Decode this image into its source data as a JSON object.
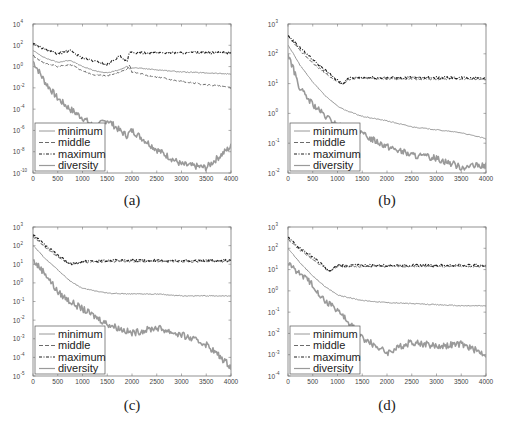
{
  "figure": {
    "panel_labels": [
      "(a)",
      "(b)",
      "(c)",
      "(d)"
    ],
    "legend": [
      "minimum",
      "middle",
      "maximum",
      "diversity"
    ],
    "line_colors": {
      "minimum": "#8c8c8c",
      "middle": "#5a5a5a",
      "maximum": "#1e1e1e",
      "diversity": "#9a9a9a"
    },
    "frame_color": "#777777"
  },
  "chart_data": [
    {
      "type": "line",
      "panel": "(a)",
      "title": "",
      "xlabel": "",
      "ylabel": "",
      "xlim": [
        0,
        4000
      ],
      "x_ticks": [
        0,
        500,
        1000,
        1500,
        2000,
        2500,
        3000,
        3500,
        4000
      ],
      "y_scale": "log",
      "y_ticks_exp": [
        4,
        2,
        0,
        -2,
        -4,
        -6,
        -8,
        -10
      ],
      "ylim_exp": [
        -10,
        4
      ],
      "legend_position": "lower left",
      "x": [
        0,
        250,
        500,
        750,
        1000,
        1250,
        1500,
        1750,
        1900,
        1950,
        2000,
        2500,
        3000,
        3500,
        4000
      ],
      "series": [
        {
          "name": "maximum",
          "log10_values": [
            2.2,
            1.6,
            1.2,
            1.5,
            0.8,
            0.5,
            0.2,
            1.0,
            0.4,
            1.3,
            1.3,
            1.3,
            1.3,
            1.3,
            1.3
          ]
        },
        {
          "name": "middle",
          "log10_values": [
            1.0,
            0.3,
            0.0,
            0.2,
            -0.4,
            -0.8,
            -0.9,
            -0.5,
            -0.3,
            0.2,
            -0.5,
            -1.0,
            -1.4,
            -1.7,
            -2.0
          ]
        },
        {
          "name": "minimum",
          "log10_values": [
            1.5,
            0.8,
            0.4,
            0.6,
            0.0,
            -0.4,
            -0.6,
            -0.3,
            0.0,
            -0.2,
            -0.1,
            -0.3,
            -0.5,
            -0.6,
            -0.7
          ]
        },
        {
          "name": "diversity",
          "log10_values": [
            0.5,
            -1.5,
            -3.0,
            -4.0,
            -4.8,
            -5.7,
            -5.0,
            -6.0,
            -6.5,
            -6.2,
            -6.0,
            -7.8,
            -9.2,
            -9.5,
            -7.5
          ]
        }
      ]
    },
    {
      "type": "line",
      "panel": "(b)",
      "xlim": [
        0,
        4000
      ],
      "x_ticks": [
        0,
        500,
        1000,
        1500,
        2000,
        2500,
        3000,
        3500,
        4000
      ],
      "y_scale": "log",
      "y_ticks_exp": [
        3,
        2,
        1,
        0,
        -1,
        -2
      ],
      "ylim_exp": [
        -2,
        3
      ],
      "legend_position": "lower left",
      "x": [
        0,
        250,
        500,
        750,
        1000,
        1100,
        1250,
        1500,
        2000,
        2500,
        3000,
        3500,
        4000
      ],
      "series": [
        {
          "name": "maximum",
          "log10_values": [
            2.6,
            2.2,
            1.8,
            1.45,
            1.1,
            1.0,
            1.2,
            1.2,
            1.2,
            1.2,
            1.2,
            1.2,
            1.2
          ]
        },
        {
          "name": "middle",
          "log10_values": [
            2.6,
            2.1,
            1.7,
            1.35,
            1.05,
            1.0,
            1.15,
            1.2,
            1.15,
            1.15,
            1.15,
            1.15,
            1.15
          ]
        },
        {
          "name": "minimum",
          "log10_values": [
            2.3,
            1.6,
            1.05,
            0.6,
            0.25,
            0.15,
            0.05,
            -0.1,
            -0.25,
            -0.45,
            -0.55,
            -0.65,
            -0.85
          ]
        },
        {
          "name": "diversity",
          "log10_values": [
            2.0,
            0.8,
            0.3,
            -0.1,
            -0.4,
            -0.45,
            -0.5,
            -0.7,
            -1.1,
            -1.4,
            -1.5,
            -1.8,
            -1.75
          ]
        }
      ]
    },
    {
      "type": "line",
      "panel": "(c)",
      "xlim": [
        0,
        4000
      ],
      "x_ticks": [
        0,
        500,
        1000,
        1500,
        2000,
        2500,
        3000,
        3500,
        4000
      ],
      "y_scale": "log",
      "y_ticks_exp": [
        3,
        2,
        1,
        0,
        -1,
        -2,
        -3,
        -4,
        -5
      ],
      "ylim_exp": [
        -5,
        3
      ],
      "legend_position": "lower left",
      "x": [
        0,
        250,
        500,
        750,
        1000,
        1500,
        2000,
        2500,
        3000,
        3500,
        4000
      ],
      "series": [
        {
          "name": "maximum",
          "log10_values": [
            2.6,
            2.0,
            1.5,
            1.0,
            1.15,
            1.2,
            1.2,
            1.2,
            1.2,
            1.2,
            1.2
          ]
        },
        {
          "name": "middle",
          "log10_values": [
            2.5,
            1.9,
            1.4,
            1.0,
            1.1,
            1.15,
            1.15,
            1.15,
            1.15,
            1.15,
            1.15
          ]
        },
        {
          "name": "minimum",
          "log10_values": [
            2.0,
            1.3,
            0.7,
            0.1,
            -0.3,
            -0.55,
            -0.6,
            -0.6,
            -0.7,
            -0.7,
            -0.7
          ]
        },
        {
          "name": "diversity",
          "log10_values": [
            1.2,
            0.5,
            -0.5,
            -1.0,
            -1.4,
            -2.2,
            -2.7,
            -2.4,
            -2.8,
            -3.3,
            -4.5
          ]
        }
      ]
    },
    {
      "type": "line",
      "panel": "(d)",
      "xlim": [
        0,
        4000
      ],
      "x_ticks": [
        0,
        500,
        1000,
        1500,
        2000,
        2500,
        3000,
        3500,
        4000
      ],
      "y_scale": "log",
      "y_ticks_exp": [
        3,
        2,
        1,
        0,
        -1,
        -2,
        -3,
        -4
      ],
      "ylim_exp": [
        -4,
        3
      ],
      "legend_position": "lower left",
      "x": [
        0,
        250,
        500,
        750,
        850,
        1000,
        1500,
        2000,
        2500,
        3000,
        3500,
        4000
      ],
      "series": [
        {
          "name": "maximum",
          "log10_values": [
            2.5,
            2.0,
            1.6,
            1.1,
            0.9,
            1.2,
            1.2,
            1.2,
            1.2,
            1.2,
            1.2,
            1.2
          ]
        },
        {
          "name": "middle",
          "log10_values": [
            2.4,
            1.9,
            1.5,
            1.05,
            0.9,
            1.15,
            1.15,
            1.15,
            1.15,
            1.15,
            1.15,
            1.15
          ]
        },
        {
          "name": "minimum",
          "log10_values": [
            2.0,
            1.3,
            0.7,
            0.2,
            0.05,
            -0.2,
            -0.45,
            -0.55,
            -0.6,
            -0.65,
            -0.7,
            -0.7
          ]
        },
        {
          "name": "diversity",
          "log10_values": [
            1.3,
            0.8,
            0.3,
            -0.5,
            -0.6,
            -0.9,
            -2.2,
            -2.9,
            -2.4,
            -2.6,
            -2.5,
            -3.0
          ]
        }
      ]
    }
  ]
}
